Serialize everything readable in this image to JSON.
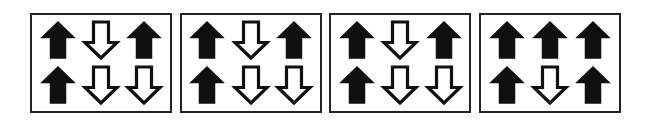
{
  "figure": {
    "background_color": "#ffffff",
    "border_color": "#242424",
    "arrow_fill_black": "#101010",
    "arrow_fill_white": "#ffffff",
    "panel_count": 4,
    "grid_rows": 2,
    "grid_columns": 3
  },
  "panels": [
    {
      "label": "panel-1",
      "cells": [
        {
          "direction": "up",
          "fill": "black",
          "icon": "arrow-up-filled-icon"
        },
        {
          "direction": "down",
          "fill": "white",
          "icon": "arrow-down-outline-icon"
        },
        {
          "direction": "up",
          "fill": "black",
          "icon": "arrow-up-filled-icon"
        },
        {
          "direction": "up",
          "fill": "black",
          "icon": "arrow-up-filled-icon"
        },
        {
          "direction": "down",
          "fill": "white",
          "icon": "arrow-down-outline-icon"
        },
        {
          "direction": "down",
          "fill": "white",
          "icon": "arrow-down-outline-icon"
        }
      ]
    },
    {
      "label": "panel-2",
      "cells": [
        {
          "direction": "up",
          "fill": "black",
          "icon": "arrow-up-filled-icon"
        },
        {
          "direction": "down",
          "fill": "white",
          "icon": "arrow-down-outline-icon"
        },
        {
          "direction": "up",
          "fill": "black",
          "icon": "arrow-up-filled-icon"
        },
        {
          "direction": "up",
          "fill": "black",
          "icon": "arrow-up-filled-icon"
        },
        {
          "direction": "down",
          "fill": "white",
          "icon": "arrow-down-outline-icon"
        },
        {
          "direction": "down",
          "fill": "white",
          "icon": "arrow-down-outline-icon"
        }
      ]
    },
    {
      "label": "panel-3",
      "cells": [
        {
          "direction": "up",
          "fill": "black",
          "icon": "arrow-up-filled-icon"
        },
        {
          "direction": "down",
          "fill": "white",
          "icon": "arrow-down-outline-icon"
        },
        {
          "direction": "up",
          "fill": "black",
          "icon": "arrow-up-filled-icon"
        },
        {
          "direction": "up",
          "fill": "black",
          "icon": "arrow-up-filled-icon"
        },
        {
          "direction": "down",
          "fill": "white",
          "icon": "arrow-down-outline-icon"
        },
        {
          "direction": "down",
          "fill": "white",
          "icon": "arrow-down-outline-icon"
        }
      ]
    },
    {
      "label": "panel-4",
      "cells": [
        {
          "direction": "up",
          "fill": "black",
          "icon": "arrow-up-filled-icon"
        },
        {
          "direction": "up",
          "fill": "black",
          "icon": "arrow-up-filled-icon"
        },
        {
          "direction": "up",
          "fill": "black",
          "icon": "arrow-up-filled-icon"
        },
        {
          "direction": "up",
          "fill": "black",
          "icon": "arrow-up-filled-icon"
        },
        {
          "direction": "down",
          "fill": "white",
          "icon": "arrow-down-outline-icon"
        },
        {
          "direction": "up",
          "fill": "black",
          "icon": "arrow-up-filled-icon"
        }
      ]
    }
  ]
}
